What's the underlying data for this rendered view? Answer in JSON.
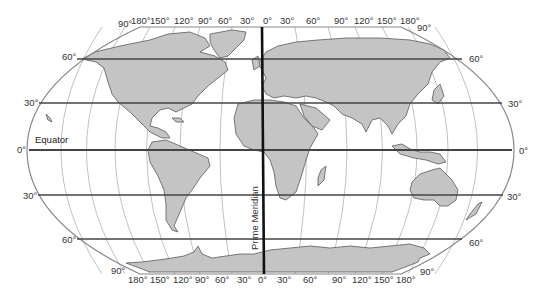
{
  "map": {
    "projection_style": "Robinson-like world map",
    "colors": {
      "land": "#c4c4c4",
      "coast": "#555555",
      "ocean": "#ffffff",
      "graticule": "#aaaaaa",
      "parallel_lines": "#444444",
      "prime_meridian": "#111111",
      "label": "#333333"
    },
    "labels": {
      "equator": "Equator",
      "prime_meridian": "Prime Meridian"
    },
    "top_longitudes": [
      "180°",
      "150°",
      "120°",
      "90°",
      "60°",
      "30°",
      "0°",
      "30°",
      "60°",
      "90°",
      "120°",
      "150°",
      "180°"
    ],
    "bottom_longitudes": [
      "180°",
      "150°",
      "120°",
      "90°",
      "60°",
      "30°",
      "0°",
      "30°",
      "60°",
      "90°",
      "120°",
      "150°",
      "180°"
    ],
    "pole_labels": {
      "top_left": "90°",
      "top_right": "90°",
      "bottom_left": "90°",
      "bottom_right": "90°"
    },
    "latitudes_left": [
      {
        "label": "60°"
      },
      {
        "label": "30°"
      },
      {
        "label": "0°"
      },
      {
        "label": "30°"
      },
      {
        "label": "60°"
      }
    ],
    "latitudes_right": [
      {
        "label": "60°"
      },
      {
        "label": "30°"
      },
      {
        "label": "0°"
      },
      {
        "label": "30°"
      },
      {
        "label": "60°"
      }
    ]
  }
}
